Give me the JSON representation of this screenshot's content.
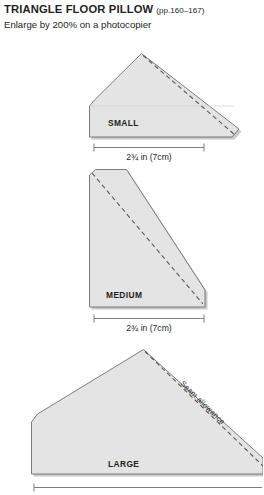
{
  "header": {
    "title": "TRIANGLE FLOOR PILLOW",
    "pages": "(pp.160–167)",
    "subtitle": "Enlarge by 200% on a photocopier"
  },
  "colors": {
    "shape_fill": "#e4e4e4",
    "shape_stroke": "#6d6e71",
    "dash_stroke": "#58595b",
    "text": "#231f20",
    "background": "#ffffff"
  },
  "patterns": [
    {
      "id": "small",
      "label": "SMALL",
      "dimension": "2¾ in (7cm)",
      "dimension_display": "2¾ in (7cm)",
      "seam_label": null
    },
    {
      "id": "medium",
      "label": "MEDIUM",
      "dimension": "2¾ in (7cm)",
      "dimension_display": "2¾ in (7cm)",
      "seam_label": null
    },
    {
      "id": "large",
      "label": "LARGE",
      "dimension": null,
      "dimension_display": null,
      "seam_label": "Seam allowance"
    }
  ]
}
